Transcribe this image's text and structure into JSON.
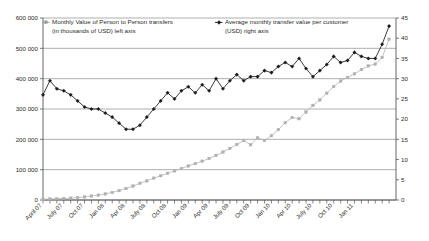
{
  "chart_data": {
    "type": "line",
    "title": "",
    "subtitle": "",
    "xlabel": "",
    "ylabel": "",
    "grid": true,
    "legend_position": "top-inside",
    "axes": {
      "left": {
        "label": "",
        "ylim": [
          0,
          600000
        ],
        "ticks": [
          0,
          100000,
          200000,
          300000,
          400000,
          500000,
          600000
        ],
        "ticklabels": [
          "0",
          "100 000",
          "200 000",
          "300 000",
          "400 000",
          "500 000",
          "600 000"
        ]
      },
      "right": {
        "label": "",
        "ylim": [
          0,
          45
        ],
        "ticks": [
          0,
          5,
          10,
          15,
          20,
          25,
          30,
          35,
          40,
          45
        ],
        "ticklabels": [
          "0",
          "5",
          "10",
          "15",
          "20",
          "25",
          "30",
          "35",
          "40",
          "45"
        ]
      },
      "x": {
        "ticklabels": [
          "April 07",
          "July 07",
          "Oct 07",
          "Jan 08",
          "Apr 08",
          "July 08",
          "Oct 08",
          "Jan 09",
          "Apr 09",
          "July 09",
          "Oct 09",
          "Jan 10",
          "Apr 10",
          "July 10",
          "Oct 10",
          "Jan 11"
        ],
        "tick_every_months": 3,
        "minor_tick_every_months": 1,
        "label_rotation_deg": -45
      }
    },
    "x": [
      "Apr 07",
      "May 07",
      "Jun 07",
      "Jul 07",
      "Aug 07",
      "Sep 07",
      "Oct 07",
      "Nov 07",
      "Dec 07",
      "Jan 08",
      "Feb 08",
      "Mar 08",
      "Apr 08",
      "May 08",
      "Jun 08",
      "Jul 08",
      "Aug 08",
      "Sep 08",
      "Oct 08",
      "Nov 08",
      "Dec 08",
      "Jan 09",
      "Feb 09",
      "Mar 09",
      "Apr 09",
      "May 09",
      "Jun 09",
      "Jul 09",
      "Aug 09",
      "Sep 09",
      "Oct 09",
      "Nov 09",
      "Dec 09",
      "Jan 10",
      "Feb 10",
      "Mar 10",
      "Apr 10",
      "May 10",
      "Jun 10",
      "Jul 10",
      "Aug 10",
      "Sep 10",
      "Oct 10",
      "Nov 10",
      "Dec 10",
      "Jan 11",
      "Feb 11",
      "Mar 11",
      "Apr 11",
      "May 11",
      "Jun 11"
    ],
    "series": [
      {
        "name": "Monthly Value of Person to Person transfers (in thousands of USD) left axis",
        "axis": "left",
        "color": "#b0b0b0",
        "marker": "square",
        "values": [
          2000,
          3000,
          4000,
          5000,
          6000,
          8000,
          10000,
          13000,
          16000,
          20000,
          25000,
          31000,
          38000,
          46000,
          55000,
          63000,
          72000,
          80000,
          88000,
          96000,
          104000,
          112000,
          120000,
          128000,
          137000,
          147000,
          158000,
          170000,
          183000,
          196000,
          182000,
          205000,
          196000,
          212000,
          232000,
          255000,
          272000,
          268000,
          290000,
          312000,
          330000,
          352000,
          374000,
          392000,
          404000,
          416000,
          430000,
          442000,
          448000,
          470000,
          530000
        ]
      },
      {
        "name": "Average monthly transfer value per customer (USD) right axis",
        "axis": "right",
        "color": "#1a1a1a",
        "marker": "diamond",
        "values": [
          26.0,
          29.5,
          27.5,
          27.0,
          26.0,
          24.5,
          23.0,
          22.5,
          22.5,
          21.5,
          20.5,
          19.0,
          17.5,
          17.5,
          18.5,
          20.5,
          22.5,
          24.5,
          26.5,
          25.0,
          27.0,
          28.0,
          26.5,
          28.5,
          27.0,
          30.0,
          27.5,
          29.5,
          31.0,
          29.5,
          30.5,
          30.5,
          32.0,
          31.5,
          33.0,
          34.0,
          33.0,
          35.0,
          32.5,
          30.5,
          32.0,
          33.5,
          35.5,
          34.0,
          34.5,
          36.5,
          35.5,
          35.0,
          35.0,
          38.5,
          43.0
        ]
      }
    ]
  },
  "legend": {
    "items": [
      {
        "label_line1": "Monthly Value of Person to Person transfers",
        "label_line2": "(in thousands of USD) left axis",
        "marker": "square-line",
        "color": "#9a9a9a"
      },
      {
        "label_line1": "Average monthly transfer value per customer",
        "label_line2": "(USD) right axis",
        "marker": "diamond-line",
        "color": "#1a1a1a"
      }
    ]
  }
}
